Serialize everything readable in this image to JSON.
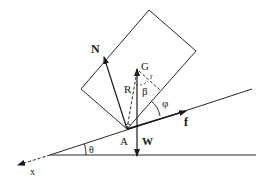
{
  "diagram": {
    "type": "physics-free-body",
    "labels": {
      "normal_force": "N",
      "center_of_gravity": "G",
      "radius_R": "R",
      "radius_r": "r",
      "beta": "β",
      "phi": "φ",
      "friction": "f",
      "contact_point": "A",
      "weight": "W",
      "theta": "θ",
      "x_axis": "x"
    },
    "colors": {
      "line": "#2a2a2a",
      "background": "#ffffff"
    }
  }
}
